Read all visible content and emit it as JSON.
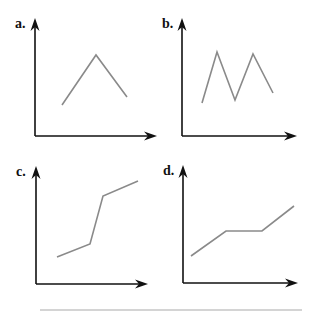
{
  "figure": {
    "colors": {
      "axis": "#111111",
      "line": "#8a8a8a",
      "bottom_rule": "#d4d4d4"
    }
  },
  "chart_data": [
    {
      "type": "line",
      "panel_label": "a.",
      "title": "",
      "xlabel": "",
      "ylabel": "",
      "grid": false,
      "shape": "single peak (rise then fall)",
      "axes": {
        "origin": [
          35,
          136
        ],
        "y_tip": [
          35,
          18
        ],
        "x_tip": [
          157,
          136
        ]
      },
      "points": [
        [
          62,
          105
        ],
        [
          96,
          55
        ],
        [
          127,
          97
        ]
      ]
    },
    {
      "type": "line",
      "panel_label": "b.",
      "title": "",
      "xlabel": "",
      "ylabel": "",
      "grid": false,
      "shape": "two peaks (M shape)",
      "axes": {
        "origin": [
          182,
          136
        ],
        "y_tip": [
          182,
          18
        ],
        "x_tip": [
          297,
          136
        ]
      },
      "points": [
        [
          202,
          103
        ],
        [
          217,
          52
        ],
        [
          235,
          100
        ],
        [
          253,
          54
        ],
        [
          273,
          93
        ]
      ]
    },
    {
      "type": "line",
      "panel_label": "c.",
      "title": "",
      "xlabel": "",
      "ylabel": "",
      "grid": false,
      "shape": "slow rise, steep rise, slow rise",
      "axes": {
        "origin": [
          36,
          284
        ],
        "y_tip": [
          36,
          166
        ],
        "x_tip": [
          148,
          284
        ]
      },
      "points": [
        [
          57,
          257
        ],
        [
          90,
          244
        ],
        [
          103,
          196
        ],
        [
          138,
          181
        ]
      ]
    },
    {
      "type": "line",
      "panel_label": "d.",
      "title": "",
      "xlabel": "",
      "ylabel": "",
      "grid": false,
      "shape": "rise, plateau, rise",
      "axes": {
        "origin": [
          183,
          283
        ],
        "y_tip": [
          183,
          165
        ],
        "x_tip": [
          298,
          283
        ]
      },
      "points": [
        [
          191,
          256
        ],
        [
          226,
          231
        ],
        [
          262,
          231
        ],
        [
          294,
          206
        ]
      ]
    }
  ]
}
